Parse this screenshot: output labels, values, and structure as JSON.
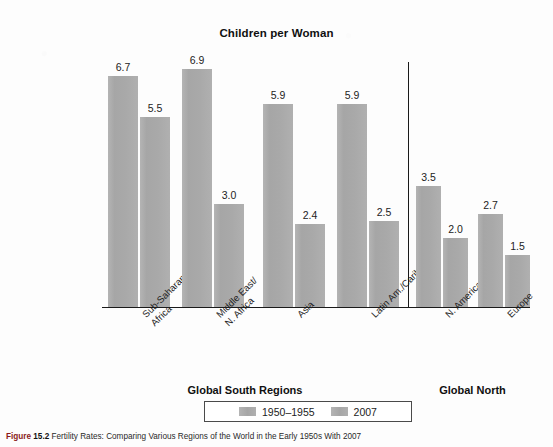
{
  "chart_data": {
    "type": "bar",
    "title": "Children per Woman",
    "xlabel": "",
    "ylabel": "",
    "ylim": [
      0,
      7.6
    ],
    "grid": false,
    "legend_position": "bottom-center",
    "categories": [
      "Sub-Saharan\nAfrica",
      "Middle East/\nN. Africa",
      "Asia",
      "Latin Am./Carib.",
      "N. America",
      "Europe"
    ],
    "series": [
      {
        "name": "1950–1955",
        "values": [
          6.7,
          6.9,
          5.9,
          5.9,
          3.5,
          2.7
        ]
      },
      {
        "name": "2007",
        "values": [
          5.5,
          3.0,
          2.4,
          2.5,
          2.0,
          1.5
        ]
      }
    ],
    "annotations": [
      "Vertical divider separates Global South Regions from Global North"
    ]
  },
  "groups": {
    "south_label": "Global South Regions",
    "north_label": "Global North",
    "south_count": 4,
    "north_count": 2
  },
  "legend": {
    "entries": [
      {
        "label": "1950–1955",
        "color": "#a9a9a9"
      },
      {
        "label": "2007",
        "color": "#a9a9a9"
      }
    ]
  },
  "caption": {
    "figure_word": "Figure",
    "figure_number": "15.2",
    "text": "Fertility Rates: Comparing Various Regions of the World in the Early 1950s With 2007"
  },
  "colors": {
    "bar_fill": "#a9a9a9",
    "axis": "#1a1a1a",
    "text": "#1a1a1a",
    "caption_accent": "#8a1a1a"
  }
}
